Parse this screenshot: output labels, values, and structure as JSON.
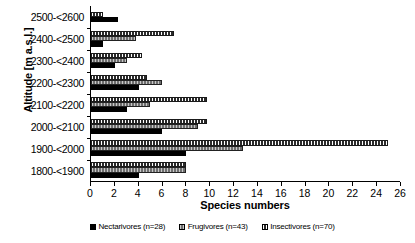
{
  "chart_data": {
    "type": "bar",
    "orientation": "horizontal",
    "title": "",
    "xlabel": "Species numbers",
    "ylabel": "Altitude [m a.s.l.]",
    "xlim": [
      0,
      26
    ],
    "xticks": [
      0,
      2,
      4,
      6,
      8,
      10,
      12,
      14,
      16,
      18,
      20,
      22,
      24,
      26
    ],
    "grid": false,
    "legend_position": "bottom",
    "categories": [
      "2500-<2600",
      "2400-<2500",
      "2300-<2400",
      "2200-<2300",
      "2100-<2200",
      "2000-<2100",
      "1900-<2000",
      "1800-<1900"
    ],
    "series": [
      {
        "name": "Insectivores (n=70)",
        "label": "Insectivores (n=70)",
        "color": "#2b2b2b",
        "pattern": "dense-vertical-hatch",
        "values": [
          1.0,
          7.0,
          4.3,
          4.7,
          9.8,
          9.8,
          25.0,
          8.0
        ]
      },
      {
        "name": "Frugivores (n=43)",
        "label": "Frugivores (n=43)",
        "color": "#9a9a9a",
        "pattern": "light-vertical-hatch",
        "values": [
          0.0,
          3.8,
          3.0,
          6.0,
          5.0,
          9.0,
          12.8,
          8.0
        ]
      },
      {
        "name": "Nectarivores (n=28)",
        "label": "Nectarivores (n=28)",
        "color": "#000000",
        "pattern": "solid",
        "values": [
          2.3,
          1.0,
          2.0,
          4.0,
          3.0,
          6.0,
          8.0,
          4.0
        ]
      }
    ]
  },
  "legend": {
    "items": [
      {
        "label": "Nectarivores (n=28)",
        "series_index": 2
      },
      {
        "label": "Frugivores (n=43)",
        "series_index": 1
      },
      {
        "label": "Insectivores (n=70)",
        "series_index": 0
      }
    ]
  }
}
